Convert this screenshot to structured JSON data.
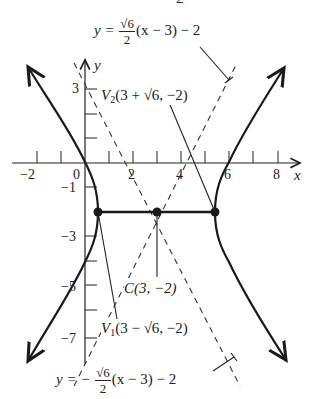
{
  "figure": {
    "cut_top_text": "2",
    "axes": {
      "x_label": "x",
      "y_label": "y",
      "x_ticks": [
        "−2",
        "0",
        "2",
        "4",
        "6",
        "8"
      ],
      "y_ticks": [
        "3",
        "−1",
        "−3",
        "−5",
        "−7"
      ]
    },
    "asymptote_upper": {
      "lhs": "y =",
      "num": "√6",
      "den": "2",
      "rest": "(x − 3) − 2"
    },
    "asymptote_lower": {
      "lhs": "y = −",
      "num": "√6",
      "den": "2",
      "rest": "(x − 3) − 2"
    },
    "vertex_2": {
      "name": "V",
      "sub": "2",
      "coords": "(3 + √6, −2)"
    },
    "vertex_1": {
      "name": "V",
      "sub": "1",
      "coords": "(3 − √6, −2)"
    },
    "center": {
      "label": "C(3, −2)"
    },
    "colors": {
      "curve": "#1a1a1a",
      "asymptote": "#333333",
      "axis": "#222222"
    }
  }
}
